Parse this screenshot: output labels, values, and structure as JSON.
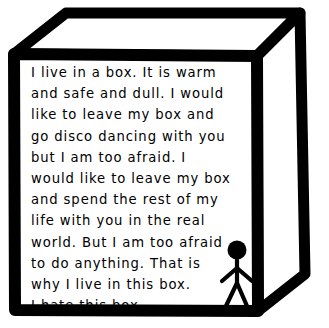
{
  "artwork": {
    "title": "I live in a box",
    "medium": "hand-drawn ink illustration",
    "background_color": "#ffffff",
    "ink_color": "#000000"
  },
  "box": {
    "name": "cardboard-box",
    "description": "open-topped box drawn in three-point-ish perspective with thick black marker outline",
    "stroke_color": "#000000",
    "fill_color": "#ffffff",
    "faces": {
      "front": "front-face",
      "top": "top-face",
      "right": "right-side-face"
    }
  },
  "message": {
    "lines": [
      "I live in a box. It is warm",
      "and safe and dull. I would",
      "like to leave my box and",
      "go disco dancing with you",
      "but I am too afraid. I",
      "would like to leave my box",
      "and spend the rest of my",
      "life with you in the real",
      "world. But I am too afraid",
      "to do anything. That is",
      "why I live in this box.",
      "I hate this box."
    ],
    "full_text": "I live in a box. It is warm and safe and dull. I would like to leave my box and go disco dancing with you but I am too afraid. I would like to leave my box and spend the rest of my life with you in the real world. But I am too afraid to do anything. That is why I live in this box. I hate this box."
  },
  "figure": {
    "name": "stick-figure",
    "color": "#000000"
  }
}
